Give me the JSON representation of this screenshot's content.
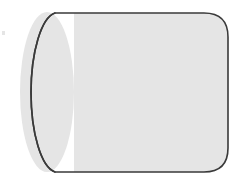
{
  "figure": {
    "title": "Cylinder",
    "kind": "geometric-solid",
    "canvas": {
      "width": 246,
      "height": 186,
      "background_color": "#ffffff"
    },
    "style": {
      "fill_color": "#e5e5e5",
      "stroke_color": "#3a3a3a",
      "stroke_width": 1.6
    },
    "geometry": {
      "body": {
        "name": "cylinder-body",
        "left": 20,
        "right": 228,
        "top": 13,
        "bottom": 172,
        "corner_radius": 24,
        "length": 208,
        "height": 159
      },
      "left_cap_ellipse": {
        "name": "left-end-cap",
        "center_x": 47,
        "center_y": 92,
        "radius_x": 27,
        "radius_y": 80
      },
      "seam_line": {
        "name": "cap-seam",
        "x": 74,
        "top_y": 13,
        "bottom_y": 172
      }
    },
    "artifacts": [
      {
        "name": "scan-speck",
        "x": 2,
        "y": 31,
        "width": 3,
        "height": 4
      }
    ]
  }
}
